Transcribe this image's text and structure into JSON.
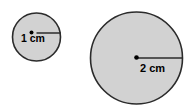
{
  "figure": {
    "background_color": "#ffffff",
    "fill_color": "#d2d2d2",
    "stroke_color": "#2b2b2b",
    "label_color": "#000000",
    "shapes": [
      {
        "name": "small-circle",
        "cx": 36.5,
        "cy": 37,
        "r": 24,
        "center_dot_r": 2,
        "radius_line": {
          "x1": 36.5,
          "y1": 33,
          "x2": 60.5,
          "y2": 33
        },
        "label": "1 cm",
        "label_x": 21,
        "label_y": 42
      },
      {
        "name": "large-circle",
        "cx": 136.5,
        "cy": 58,
        "r": 46,
        "center_dot_r": 2.3,
        "radius_line": {
          "x1": 136.5,
          "y1": 58,
          "x2": 182.5,
          "y2": 58
        },
        "label": "2 cm",
        "label_x": 140,
        "label_y": 72
      }
    ]
  },
  "labels": {
    "small_circle_radius": "1 cm",
    "large_circle_radius": "2 cm"
  }
}
